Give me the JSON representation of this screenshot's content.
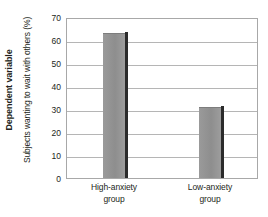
{
  "chart_data": {
    "type": "bar",
    "title": "",
    "subtitle": "",
    "categories": [
      "High-anxiety group",
      "Low-anxiety group"
    ],
    "category_lines": [
      [
        "High-anxiety",
        "group"
      ],
      [
        "Low-anxiety",
        "group"
      ]
    ],
    "values": [
      63,
      31
    ],
    "series": [
      {
        "name": "Subjects wanting to wait with others (%)",
        "values": [
          63,
          31
        ]
      }
    ],
    "xlabel": "",
    "ylabel": "Subjects wanting to wait with others (%)",
    "outer_ylabel": "Dependent variable",
    "ylim": [
      0,
      70
    ],
    "ytick_values": [
      0,
      10,
      20,
      30,
      40,
      50,
      60,
      70
    ],
    "ytick_labels": [
      "0",
      "10",
      "20",
      "30",
      "40",
      "50",
      "60",
      "70"
    ],
    "grid": true,
    "grid_axis": "y",
    "legend": false,
    "legend_position": "none",
    "bar_color": "#919191",
    "bar_shadow_color": "#2b2b2b",
    "gridline_color": "#b5b5b5",
    "frame_color": "#a8a8a8",
    "text_color": "#231f20",
    "background_color": "#ffffff"
  },
  "labels": {
    "outer_axis_title": "Dependent variable",
    "inner_axis_title": "Subjects wanting to wait with others (%)"
  }
}
